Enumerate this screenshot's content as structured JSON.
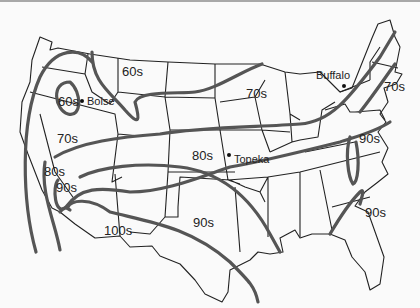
{
  "map": {
    "type": "isotherm-map",
    "region": "Contiguous United States",
    "colors": {
      "background": "#fafafa",
      "state_lines": "#222222",
      "isotherm_lines": "#555555",
      "top_border": "#a8a8a8"
    },
    "temperature_labels": [
      {
        "id": "nw-60s",
        "text": "60s"
      },
      {
        "id": "boise-60s",
        "text": "60s"
      },
      {
        "id": "ne-plains-70s",
        "text": "70s"
      },
      {
        "id": "west-70s",
        "text": "70s"
      },
      {
        "id": "ne-70s",
        "text": "70s"
      },
      {
        "id": "central-80s",
        "text": "80s"
      },
      {
        "id": "sw-80s",
        "text": "80s"
      },
      {
        "id": "sw-90s",
        "text": "90s"
      },
      {
        "id": "mid-atlantic-90s",
        "text": "90s"
      },
      {
        "id": "texas-90s",
        "text": "90s"
      },
      {
        "id": "southeast-90s",
        "text": "90s"
      },
      {
        "id": "desert-100s",
        "text": "100s"
      }
    ],
    "cities": [
      {
        "id": "boise",
        "name": "Boise"
      },
      {
        "id": "topeka",
        "name": "Topeka"
      },
      {
        "id": "buffalo",
        "name": "Buffalo"
      }
    ]
  }
}
